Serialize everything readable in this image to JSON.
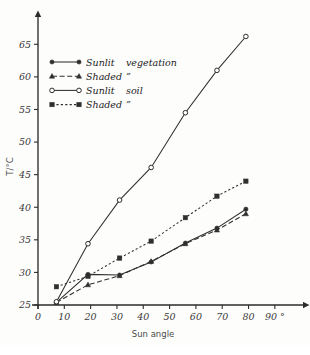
{
  "chart_data": {
    "type": "line",
    "title": "",
    "xlabel": "Sun angle",
    "ylabel": "T/°C",
    "xlim": [
      0,
      95
    ],
    "ylim": [
      25,
      67
    ],
    "grid": false,
    "legend_position": "upper-left",
    "x_ticks": [
      "0",
      "10",
      "20",
      "30",
      "40",
      "50",
      "60",
      "70",
      "80",
      "90 °"
    ],
    "x_tick_values": [
      0,
      10,
      20,
      30,
      40,
      50,
      60,
      70,
      80,
      90
    ],
    "y_ticks": [
      "25",
      "30",
      "35",
      "40",
      "45",
      "50",
      "55",
      "60",
      "65"
    ],
    "y_tick_values": [
      25,
      30,
      35,
      40,
      45,
      50,
      55,
      60,
      65
    ],
    "series": [
      {
        "name": "Sunlit vegetation",
        "marker": "filled-circle",
        "line_style": "solid",
        "x": [
          7,
          19,
          31,
          43,
          56,
          68,
          79
        ],
        "y": [
          25.4,
          29.7,
          29.6,
          31.6,
          34.5,
          36.8,
          39.7
        ]
      },
      {
        "name": "Shaded ”",
        "marker": "filled-triangle",
        "line_style": "dashed",
        "x": [
          7,
          19,
          31,
          43,
          56,
          68,
          79
        ],
        "y": [
          25.4,
          28.1,
          29.5,
          31.7,
          34.4,
          36.5,
          39.0
        ]
      },
      {
        "name": "Sunlit soil",
        "marker": "open-circle",
        "line_style": "solid",
        "x": [
          7,
          19,
          31,
          43,
          56,
          68,
          79
        ],
        "y": [
          25.5,
          34.4,
          41.1,
          46.1,
          54.5,
          61.0,
          66.2
        ]
      },
      {
        "name": "Shaded ”",
        "marker": "filled-square",
        "line_style": "dotted",
        "x": [
          7,
          19,
          31,
          43,
          56,
          68,
          79
        ],
        "y": [
          27.8,
          29.4,
          32.2,
          34.8,
          38.4,
          41.7,
          44.0
        ]
      }
    ],
    "legend": [
      {
        "label": "Sunlit",
        "label2": "vegetation",
        "marker": "filled-circle",
        "line_style": "solid"
      },
      {
        "label": "Shaded",
        "label2": "”",
        "marker": "filled-triangle",
        "line_style": "dashed"
      },
      {
        "label": "Sunlit",
        "label2": "soil",
        "marker": "open-circle",
        "line_style": "solid"
      },
      {
        "label": "Shaded",
        "label2": "”",
        "marker": "filled-square",
        "line_style": "dotted"
      }
    ],
    "colors": {
      "ink": "#2f2f2f",
      "axis": "#2b2b2b",
      "background": "#fdfdfc"
    }
  }
}
